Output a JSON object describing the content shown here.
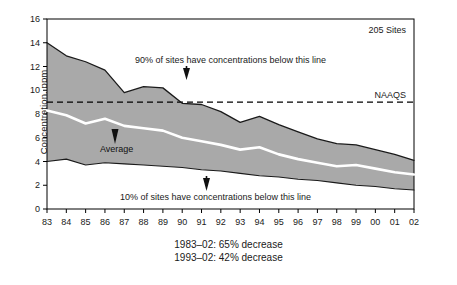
{
  "chart_data": {
    "type": "area",
    "title": "",
    "subtitle": "",
    "xlabel": "",
    "ylabel": "Concentration, ppm",
    "ylim": [
      0,
      16
    ],
    "ytick_values": [
      0,
      2,
      4,
      6,
      8,
      10,
      12,
      14,
      16
    ],
    "ytick_labels": [
      "0",
      "2",
      "4",
      "6",
      "8",
      "10",
      "12",
      "14",
      "16"
    ],
    "grid": false,
    "legend_position": "none",
    "x": [
      1983,
      1984,
      1985,
      1986,
      1987,
      1988,
      1989,
      1990,
      1991,
      1992,
      1993,
      1994,
      1995,
      1996,
      1997,
      1998,
      1999,
      2000,
      2001,
      2002
    ],
    "categories": [
      "83",
      "84",
      "85",
      "86",
      "87",
      "88",
      "89",
      "90",
      "91",
      "92",
      "93",
      "94",
      "95",
      "96",
      "97",
      "98",
      "99",
      "00",
      "01",
      "02"
    ],
    "series": [
      {
        "name": "90th percentile",
        "label": "90% of sites have concentrations below this line",
        "values": [
          14.0,
          12.9,
          12.4,
          11.7,
          9.8,
          10.3,
          10.2,
          8.9,
          8.8,
          8.2,
          7.3,
          7.8,
          7.1,
          6.5,
          5.9,
          5.5,
          5.4,
          5.0,
          4.6,
          4.1
        ]
      },
      {
        "name": "Average",
        "label": "Average",
        "values": [
          8.3,
          7.9,
          7.2,
          7.6,
          7.0,
          6.8,
          6.6,
          6.0,
          5.7,
          5.4,
          5.0,
          5.2,
          4.6,
          4.2,
          3.9,
          3.6,
          3.7,
          3.4,
          3.1,
          2.9
        ]
      },
      {
        "name": "10th percentile",
        "label": "10% of sites have concentrations below this line",
        "values": [
          4.0,
          4.2,
          3.7,
          3.9,
          3.8,
          3.7,
          3.6,
          3.5,
          3.3,
          3.2,
          3.0,
          2.8,
          2.7,
          2.5,
          2.4,
          2.2,
          2.0,
          1.9,
          1.7,
          1.6
        ]
      }
    ],
    "reference_line": {
      "label": "NAAQS",
      "value": 9.0,
      "style": "dashed"
    },
    "annotations": [
      {
        "name": "sites-count",
        "text": "205 Sites"
      },
      {
        "name": "upper-band-note",
        "text": "90% of sites have concentrations below this line"
      },
      {
        "name": "average-note",
        "text": "Average"
      },
      {
        "name": "lower-band-note",
        "text": "10% of sites have concentrations below this line"
      }
    ],
    "captions": [
      "1983–02: 65% decrease",
      "1993–02: 42% decrease"
    ],
    "colors": {
      "band_fill": "#a9a9a9",
      "band_edge": "#1a1a1a",
      "average_line": "#ffffff",
      "reference_line": "#000000",
      "axis": "#000000",
      "text": "#1a1a1a"
    }
  },
  "axis": {
    "y_title": "Concentration, ppm",
    "y_ticks": [
      "16",
      "14",
      "12",
      "10",
      "8",
      "6",
      "4",
      "2",
      "0"
    ],
    "x_ticks": [
      "83",
      "84",
      "85",
      "86",
      "87",
      "88",
      "89",
      "90",
      "91",
      "92",
      "93",
      "94",
      "95",
      "96",
      "97",
      "98",
      "99",
      "00",
      "01",
      "02"
    ]
  },
  "labels": {
    "sites": "205 Sites",
    "naaqs": "NAAQS",
    "upper_note": "90% of sites have concentrations below this line",
    "average_note": "Average",
    "lower_note": "10% of sites have concentrations below this line"
  },
  "captions": {
    "line1": "1983–02: 65% decrease",
    "line2": "1993–02: 42% decrease"
  }
}
